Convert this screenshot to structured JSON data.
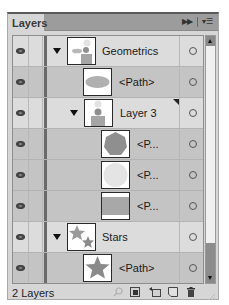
{
  "panel": {
    "tab_label": "Layers",
    "collapse_icon": "double-chevron-right-icon",
    "menu_icon": "panel-menu-icon"
  },
  "rows": [
    {
      "name": "Geometrics",
      "kind": "layer",
      "depth": 0,
      "expanded": true,
      "thumbnail": "geometrics-composite",
      "visible": true
    },
    {
      "name": "<Path>",
      "kind": "path",
      "depth": 1,
      "expanded": false,
      "thumbnail": "ellipse",
      "visible": true
    },
    {
      "name": "Layer 3",
      "kind": "sublayer",
      "depth": 1,
      "expanded": true,
      "thumbnail": "layer3-composite",
      "visible": true,
      "selected_art": true
    },
    {
      "name": "<P...",
      "kind": "path",
      "depth": 2,
      "expanded": false,
      "thumbnail": "heptagon",
      "visible": true
    },
    {
      "name": "<P...",
      "kind": "path",
      "depth": 2,
      "expanded": false,
      "thumbnail": "circle",
      "visible": true
    },
    {
      "name": "<P...",
      "kind": "path",
      "depth": 2,
      "expanded": false,
      "thumbnail": "rectangle",
      "visible": true
    },
    {
      "name": "Stars",
      "kind": "layer",
      "depth": 0,
      "expanded": true,
      "thumbnail": "two-stars",
      "visible": true
    },
    {
      "name": "<Path>",
      "kind": "path",
      "depth": 1,
      "expanded": false,
      "thumbnail": "star",
      "visible": true
    }
  ],
  "footer": {
    "count_label": "2 Layers",
    "tools": [
      "locate-object-icon",
      "make-clipping-mask-icon",
      "create-sublayer-icon",
      "create-layer-icon",
      "trash-icon"
    ]
  },
  "colors": {
    "layer_color_bar": "#6a6a6a",
    "thumbnail_fill": "#8f8f8f",
    "panel_bg": "#d6d6d6"
  }
}
